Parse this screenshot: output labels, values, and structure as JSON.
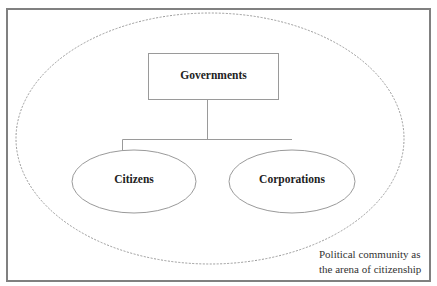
{
  "diagram": {
    "top_node": {
      "label": "Governments"
    },
    "child_nodes": [
      {
        "label": "Citizens"
      },
      {
        "label": "Corporations"
      }
    ],
    "boundary_note": {
      "line1": "Political community as",
      "line2": "the arena of citizenship"
    },
    "colors": {
      "frame": "#808080",
      "shape_stroke": "#9a9a9a",
      "dashed_boundary": "#9a9a9a",
      "text": "#222222"
    }
  }
}
